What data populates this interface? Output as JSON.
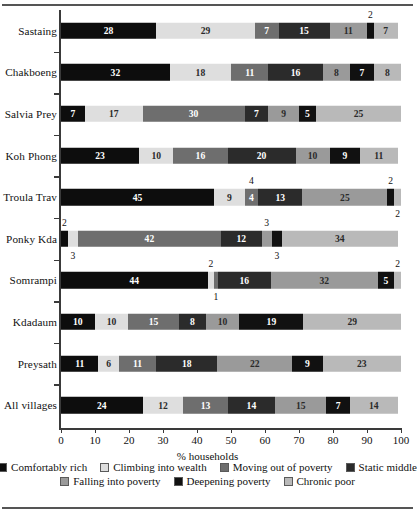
{
  "chart_data": {
    "type": "bar",
    "subtype": "stacked-horizontal-bar",
    "title": "",
    "xlabel": "% households",
    "ylabel": "",
    "xlim": [
      0,
      100
    ],
    "xticks": [
      0,
      10,
      20,
      30,
      40,
      50,
      60,
      70,
      80,
      90,
      100
    ],
    "xtick_labels": [
      "0",
      "10",
      "20",
      "30",
      "40",
      "50",
      "60",
      "70",
      "80",
      "90",
      "100"
    ],
    "grid": false,
    "legend_position": "bottom",
    "categories": [
      "Sastaing",
      "Chakboeng",
      "Salvia Prey",
      "Koh Phong",
      "Troula Trav",
      "Ponky Kda",
      "Somrampi",
      "Kdadaum",
      "Preysath",
      "All villages"
    ],
    "series": [
      {
        "name": "Comfortably rich",
        "color": "#0d0d0d",
        "label_color": "light",
        "values": [
          28,
          32,
          7,
          23,
          45,
          2,
          44,
          10,
          11,
          24
        ]
      },
      {
        "name": "Climbing into wealth",
        "color": "#dedede",
        "label_color": "dark",
        "values": [
          29,
          18,
          17,
          10,
          9,
          3,
          2,
          10,
          6,
          12
        ]
      },
      {
        "name": "Moving out of poverty",
        "color": "#6e6e6e",
        "label_color": "light",
        "values": [
          7,
          11,
          30,
          16,
          4,
          42,
          1,
          15,
          11,
          13
        ]
      },
      {
        "name": "Static middle",
        "color": "#2b2b2b",
        "label_color": "light",
        "values": [
          15,
          16,
          7,
          20,
          13,
          12,
          16,
          8,
          18,
          14
        ]
      },
      {
        "name": "Falling into poverty",
        "color": "#9a9a9a",
        "label_color": "dark",
        "values": [
          11,
          8,
          9,
          10,
          25,
          3,
          32,
          10,
          22,
          15
        ]
      },
      {
        "name": "Deepening poverty",
        "color": "#111111",
        "label_color": "light",
        "values": [
          2,
          7,
          5,
          9,
          2,
          3,
          5,
          19,
          9,
          7
        ]
      },
      {
        "name": "Chronic poor",
        "color": "#b9b9b9",
        "label_color": "dark",
        "values": [
          7,
          8,
          25,
          11,
          2,
          34,
          2,
          29,
          23,
          14
        ]
      }
    ],
    "callouts": [
      {
        "row": "Sastaing",
        "series": "Deepening poverty",
        "value": "2",
        "position": "above"
      },
      {
        "row": "Troula Trav",
        "series": "Moving out of poverty",
        "value": "4",
        "position": "above"
      },
      {
        "row": "Troula Trav",
        "series": "Deepening poverty",
        "value": "2",
        "position": "above"
      },
      {
        "row": "Troula Trav",
        "series": "Chronic poor",
        "value": "2",
        "position": "below"
      },
      {
        "row": "Ponky Kda",
        "series": "Comfortably rich",
        "value": "2",
        "position": "above"
      },
      {
        "row": "Ponky Kda",
        "series": "Climbing into wealth",
        "value": "3",
        "position": "below"
      },
      {
        "row": "Ponky Kda",
        "series": "Falling into poverty",
        "value": "3",
        "position": "above"
      },
      {
        "row": "Ponky Kda",
        "series": "Deepening poverty",
        "value": "3",
        "position": "below"
      },
      {
        "row": "Somrampi",
        "series": "Climbing into wealth",
        "value": "2",
        "position": "above"
      },
      {
        "row": "Somrampi",
        "series": "Moving out of poverty",
        "value": "1",
        "position": "below"
      },
      {
        "row": "Somrampi",
        "series": "Chronic poor",
        "value": "2",
        "position": "above"
      }
    ]
  },
  "axis": {
    "x_title": "% households",
    "tick_labels": [
      "0",
      "10",
      "20",
      "30",
      "40",
      "50",
      "60",
      "70",
      "80",
      "90",
      "100"
    ]
  },
  "legend": {
    "row1": [
      {
        "label": "Comfortably rich",
        "color": "#0d0d0d"
      },
      {
        "label": "Climbing into wealth",
        "color": "#dedede"
      },
      {
        "label": "Moving out of poverty",
        "color": "#6e6e6e"
      },
      {
        "label": "Static middle",
        "color": "#2b2b2b"
      }
    ],
    "row2": [
      {
        "label": "Falling into poverty",
        "color": "#9a9a9a"
      },
      {
        "label": "Deepening poverty",
        "color": "#111111"
      },
      {
        "label": "Chronic poor",
        "color": "#b9b9b9"
      }
    ]
  }
}
